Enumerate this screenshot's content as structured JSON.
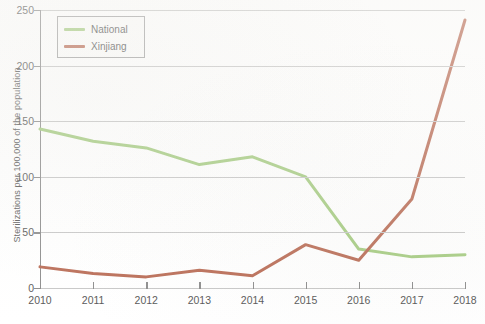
{
  "chart_data": {
    "type": "line",
    "title": "",
    "xlabel": "",
    "ylabel": "Sterilizations per 100,000 of the population",
    "categories": [
      "2010",
      "2011",
      "2012",
      "2013",
      "2014",
      "2015",
      "2016",
      "2017",
      "2018"
    ],
    "x": [
      2010,
      2011,
      2012,
      2013,
      2014,
      2015,
      2016,
      2017,
      2018
    ],
    "xlim": [
      2010,
      2018
    ],
    "ylim": [
      0,
      250
    ],
    "yticks": [
      0,
      50,
      100,
      150,
      200,
      250
    ],
    "ytick_labels": [
      "0",
      "50",
      "100",
      "150",
      "200",
      "250"
    ],
    "grid": "horizontal",
    "legend_position": "top-left",
    "series": [
      {
        "name": "National",
        "color": "#8fbf62",
        "values": [
          143,
          132,
          126,
          111,
          118,
          100,
          35,
          28,
          30
        ]
      },
      {
        "name": "Xinjiang",
        "color": "#a8472b",
        "values": [
          19,
          13,
          10,
          16,
          11,
          39,
          25,
          80,
          241
        ]
      }
    ]
  },
  "legend": {
    "items": [
      {
        "label": "National",
        "color": "#8fbf62",
        "swatch_name": "legend-swatch-national"
      },
      {
        "label": "Xinjiang",
        "color": "#a8472b",
        "swatch_name": "legend-swatch-xinjiang"
      }
    ]
  }
}
